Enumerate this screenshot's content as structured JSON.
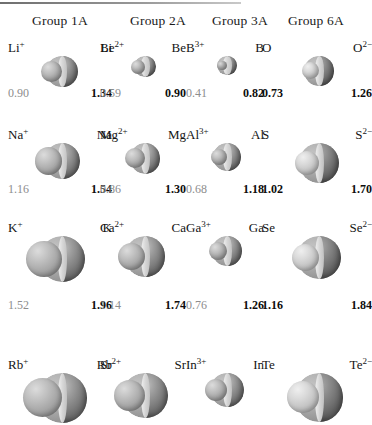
{
  "figure": {
    "units": "angstrom",
    "background": "#ffffff",
    "ion_value_color": "#8d8d8d",
    "atom_value_color": "#0d0d0d"
  },
  "columns": [
    {
      "header": "Group 1A"
    },
    {
      "header": "Group 2A"
    },
    {
      "header": "Group 3A"
    },
    {
      "header": "Group 6A"
    }
  ],
  "chart_data": {
    "type": "table",
    "xlabel": "Group",
    "ylabel": "Radius",
    "categories": [
      "Group 1A",
      "Group 2A",
      "Group 3A",
      "Group 6A"
    ],
    "series": [
      {
        "name": "Period 2",
        "cells": [
          {
            "left_label": "Li",
            "left_charge": "+",
            "right_label": "Li",
            "right_charge": "",
            "left_value": "0.90",
            "right_value": "1.34",
            "left_kind": "cation",
            "right_kind": "atom"
          },
          {
            "left_label": "Be",
            "left_charge": "2+",
            "right_label": "Be",
            "right_charge": "",
            "left_value": "0.59",
            "right_value": "0.90",
            "left_kind": "cation",
            "right_kind": "atom"
          },
          {
            "left_label": "B",
            "left_charge": "3+",
            "right_label": "B",
            "right_charge": "",
            "left_value": "0.41",
            "right_value": "0.82",
            "left_kind": "cation",
            "right_kind": "atom"
          },
          {
            "left_label": "O",
            "left_charge": "",
            "right_label": "O",
            "right_charge": "2−",
            "left_value": "0.73",
            "right_value": "1.26",
            "left_kind": "atom",
            "right_kind": "anion"
          }
        ]
      },
      {
        "name": "Period 3",
        "cells": [
          {
            "left_label": "Na",
            "left_charge": "+",
            "right_label": "Na",
            "right_charge": "",
            "left_value": "1.16",
            "right_value": "1.54",
            "left_kind": "cation",
            "right_kind": "atom"
          },
          {
            "left_label": "Mg",
            "left_charge": "2+",
            "right_label": "Mg",
            "right_charge": "",
            "left_value": "0.86",
            "right_value": "1.30",
            "left_kind": "cation",
            "right_kind": "atom"
          },
          {
            "left_label": "Al",
            "left_charge": "3+",
            "right_label": "Al",
            "right_charge": "",
            "left_value": "0.68",
            "right_value": "1.18",
            "left_kind": "cation",
            "right_kind": "atom"
          },
          {
            "left_label": "S",
            "left_charge": "",
            "right_label": "S",
            "right_charge": "2−",
            "left_value": "1.02",
            "right_value": "1.70",
            "left_kind": "atom",
            "right_kind": "anion"
          }
        ]
      },
      {
        "name": "Period 4",
        "cells": [
          {
            "left_label": "K",
            "left_charge": "+",
            "right_label": "K",
            "right_charge": "",
            "left_value": "1.52",
            "right_value": "1.96",
            "left_kind": "cation",
            "right_kind": "atom"
          },
          {
            "left_label": "Ca",
            "left_charge": "2+",
            "right_label": "Ca",
            "right_charge": "",
            "left_value": "1.14",
            "right_value": "1.74",
            "left_kind": "cation",
            "right_kind": "atom"
          },
          {
            "left_label": "Ga",
            "left_charge": "3+",
            "right_label": "Ga",
            "right_charge": "",
            "left_value": "0.76",
            "right_value": "1.26",
            "left_kind": "cation",
            "right_kind": "atom"
          },
          {
            "left_label": "Se",
            "left_charge": "",
            "right_label": "Se",
            "right_charge": "2−",
            "left_value": "1.16",
            "right_value": "1.84",
            "left_kind": "atom",
            "right_kind": "anion"
          }
        ]
      },
      {
        "name": "Period 5",
        "cells": [
          {
            "left_label": "Rb",
            "left_charge": "+",
            "right_label": "Rb",
            "right_charge": "",
            "left_value": "",
            "right_value": "",
            "left_kind": "cation",
            "right_kind": "atom"
          },
          {
            "left_label": "Sr",
            "left_charge": "2+",
            "right_label": "Sr",
            "right_charge": "",
            "left_value": "",
            "right_value": "",
            "left_kind": "cation",
            "right_kind": "atom"
          },
          {
            "left_label": "In",
            "left_charge": "3+",
            "right_label": "In",
            "right_charge": "",
            "left_value": "",
            "right_value": "",
            "left_kind": "cation",
            "right_kind": "atom"
          },
          {
            "left_label": "Te",
            "left_charge": "",
            "right_label": "Te",
            "right_charge": "2−",
            "left_value": "",
            "right_value": "",
            "left_kind": "atom",
            "right_kind": "anion"
          }
        ]
      }
    ]
  }
}
